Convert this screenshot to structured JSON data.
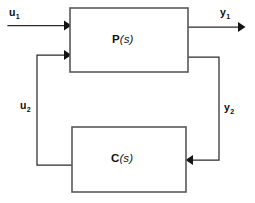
{
  "diagram": {
    "type": "feedback-interconnection-block-diagram",
    "blocks": [
      {
        "id": "plant",
        "label_name": "P",
        "label_arg": "(s)",
        "label_full": "P(s)"
      },
      {
        "id": "controller",
        "label_name": "C",
        "label_arg": "(s)",
        "label_full": "C(s)"
      }
    ],
    "signals": [
      {
        "id": "u1",
        "base": "u",
        "sub": "1",
        "full": "u1",
        "role": "exogenous-input-to-plant"
      },
      {
        "id": "y1",
        "base": "y",
        "sub": "1",
        "full": "y1",
        "role": "plant-output"
      },
      {
        "id": "u2",
        "base": "u",
        "sub": "2",
        "full": "u2",
        "role": "controller-output-to-plant"
      },
      {
        "id": "y2",
        "base": "y",
        "sub": "2",
        "full": "y2",
        "role": "plant-output-to-controller"
      }
    ],
    "colors": {
      "background": "#ffffff",
      "block_stroke": "#58585a",
      "wire_stroke": "#2b2b2b",
      "arrow_fill": "#141414",
      "text": "#111111"
    }
  }
}
